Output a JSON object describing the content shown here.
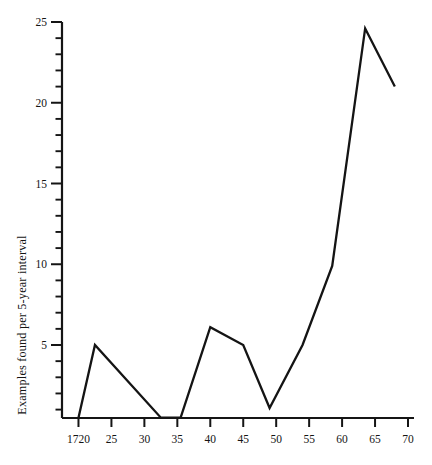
{
  "chart_data": {
    "type": "line",
    "title": "",
    "xlabel": "",
    "ylabel": "Examples found per 5-year interval",
    "xlim": [
      1717.5,
      1770
    ],
    "ylim": [
      0,
      25
    ],
    "grid": false,
    "legend": null,
    "x_tick_labels": [
      "1720",
      "25",
      "30",
      "35",
      "40",
      "45",
      "50",
      "55",
      "60",
      "65",
      "70"
    ],
    "x_tick_values": [
      1720,
      1725,
      1730,
      1735,
      1740,
      1745,
      1750,
      1755,
      1760,
      1765,
      1770
    ],
    "y_tick_labels": [
      "5",
      "10",
      "15",
      "20",
      "25"
    ],
    "y_tick_values": [
      5,
      10,
      15,
      20,
      25
    ],
    "y_minor_step": 1,
    "x": [
      1720.0,
      1722.5,
      1732.5,
      1735.5,
      1740.0,
      1745.0,
      1749.0,
      1754.0,
      1758.5,
      1763.5,
      1768.0
    ],
    "values": [
      0.5,
      5.0,
      0.5,
      0.5,
      6.1,
      5.0,
      1.1,
      5.0,
      9.9,
      24.6,
      21.0
    ],
    "series": [
      {
        "name": "Examples found per 5-year interval",
        "points": [
          {
            "x": 1720.0,
            "y": 0.5
          },
          {
            "x": 1722.5,
            "y": 5.0
          },
          {
            "x": 1732.5,
            "y": 0.5
          },
          {
            "x": 1735.5,
            "y": 0.5
          },
          {
            "x": 1740.0,
            "y": 6.1
          },
          {
            "x": 1745.0,
            "y": 5.0
          },
          {
            "x": 1749.0,
            "y": 1.1
          },
          {
            "x": 1754.0,
            "y": 5.0
          },
          {
            "x": 1758.5,
            "y": 9.9
          },
          {
            "x": 1763.5,
            "y": 24.6
          },
          {
            "x": 1768.0,
            "y": 21.0
          }
        ]
      }
    ],
    "line_color": "#141414",
    "axis_color": "#151515",
    "background_color": "#ffffff"
  }
}
